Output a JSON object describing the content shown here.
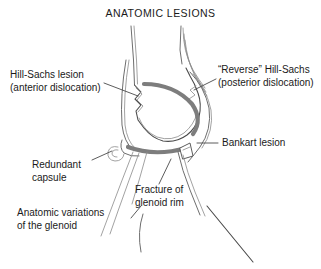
{
  "figure": {
    "title": "ANATOMIC LESIONS",
    "width": 321,
    "height": 269,
    "background": "#ffffff"
  },
  "colors": {
    "text": "#1a1a1a",
    "outline": "#6e6e6e",
    "outline_dark": "#4a4a4a",
    "glenoid_arc": "#7d7d7d",
    "leader_line": "#4a4a4a",
    "background": "#ffffff"
  },
  "labels": [
    {
      "id": "hill-sachs",
      "line1": "Hill-Sachs lesion",
      "line2": "(anterior dislocation)",
      "align": "left",
      "x": 10,
      "y": 78
    },
    {
      "id": "reverse-hill-sachs",
      "line1": "“Reverse” Hill-Sachs",
      "line2": "(posterior dislocation)",
      "align": "left",
      "x": 218,
      "y": 73
    },
    {
      "id": "bankart",
      "line1": "Bankart lesion",
      "line2": "",
      "align": "left",
      "x": 222,
      "y": 146
    },
    {
      "id": "redundant-capsule",
      "line1": "Redundant",
      "line2": "capsule",
      "align": "left",
      "x": 32,
      "y": 168
    },
    {
      "id": "fracture-glenoid-rim",
      "line1": "Fracture of",
      "line2": "glenoid rim",
      "align": "left",
      "x": 135,
      "y": 193
    },
    {
      "id": "anatomic-variations",
      "line1": "Anatomic variations",
      "line2": "of the glenoid",
      "align": "left",
      "x": 17,
      "y": 216
    }
  ]
}
